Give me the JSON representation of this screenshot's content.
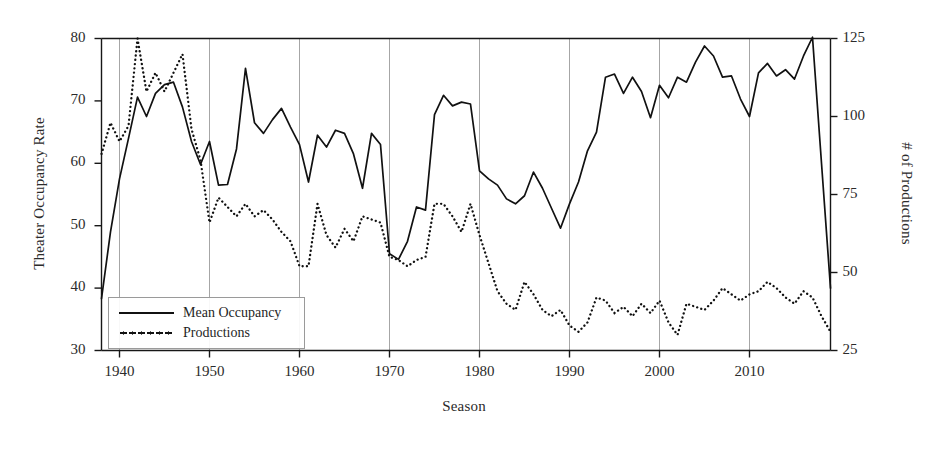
{
  "chart_data": {
    "type": "line",
    "title": "",
    "xlabel": "Season",
    "ylabel": "Theater Occupancy Rate",
    "ylabel_right": "# of Productions",
    "xlim": [
      1938,
      2019
    ],
    "ylim": [
      30,
      80
    ],
    "ylim_right": [
      25,
      125
    ],
    "grid": "vertical gridlines at each decade",
    "legend_position": "lower left, inside axes",
    "xticks": [
      1940,
      1950,
      1960,
      1970,
      1980,
      1990,
      2000,
      2010
    ],
    "xtick_labels": [
      "1940",
      "1950",
      "1960",
      "1970",
      "1980",
      "1990",
      "2000",
      "2010"
    ],
    "yticks_left": [
      30,
      40,
      50,
      60,
      70,
      80
    ],
    "ytick_labels_left": [
      "30",
      "40",
      "50",
      "60",
      "70",
      "80"
    ],
    "yticks_right": [
      25,
      50,
      75,
      100,
      125
    ],
    "ytick_labels_right": [
      "25",
      "50",
      "75",
      "100",
      "125"
    ],
    "x": [
      1938,
      1939,
      1940,
      1941,
      1942,
      1943,
      1944,
      1945,
      1946,
      1947,
      1948,
      1949,
      1950,
      1951,
      1952,
      1953,
      1954,
      1955,
      1956,
      1957,
      1958,
      1959,
      1960,
      1961,
      1962,
      1963,
      1964,
      1965,
      1966,
      1967,
      1968,
      1969,
      1970,
      1971,
      1972,
      1973,
      1974,
      1975,
      1976,
      1977,
      1978,
      1979,
      1980,
      1981,
      1982,
      1983,
      1984,
      1985,
      1986,
      1987,
      1988,
      1989,
      1990,
      1991,
      1992,
      1993,
      1994,
      1995,
      1996,
      1997,
      1998,
      1999,
      2000,
      2001,
      2002,
      2003,
      2004,
      2005,
      2006,
      2007,
      2008,
      2009,
      2010,
      2011,
      2012,
      2013,
      2014,
      2015,
      2016,
      2017,
      2018,
      2019
    ],
    "series": [
      {
        "name": "Mean Occupancy",
        "style": "solid",
        "axis": "left",
        "color": "#111111",
        "values": [
          38.3,
          49.0,
          57.5,
          64.0,
          70.6,
          67.5,
          71.2,
          72.6,
          73.0,
          69.0,
          63.5,
          59.8,
          63.5,
          56.5,
          56.6,
          62.3,
          75.2,
          66.5,
          64.8,
          67.0,
          68.8,
          65.8,
          63.0,
          57.0,
          64.5,
          62.6,
          65.3,
          64.8,
          61.5,
          56.0,
          64.8,
          63.0,
          45.5,
          44.6,
          47.5,
          53.0,
          52.5,
          67.8,
          70.9,
          69.2,
          69.8,
          69.5,
          58.8,
          57.5,
          56.5,
          54.3,
          53.5,
          54.8,
          58.6,
          56.0,
          52.8,
          49.6,
          53.5,
          57.0,
          62.0,
          65.0,
          73.8,
          74.3,
          71.2,
          73.8,
          71.5,
          67.3,
          72.5,
          70.5,
          73.8,
          73.0,
          76.2,
          78.8,
          77.2,
          73.8,
          74.0,
          70.3,
          67.5,
          74.5,
          76.0,
          74.0,
          75.0,
          73.5,
          77.2,
          80.2,
          60.0,
          40.0
        ]
      },
      {
        "name": "Productions",
        "style": "dotted",
        "axis": "right",
        "color": "#111111",
        "values": [
          88,
          98,
          92,
          97,
          125,
          108,
          114,
          108,
          114,
          120,
          96,
          86,
          66,
          74,
          71,
          68,
          72,
          68,
          70,
          67,
          63,
          60,
          52,
          52,
          72,
          62,
          58,
          64,
          60,
          68,
          67,
          66,
          55,
          54,
          52,
          54,
          55,
          72,
          72,
          68,
          63,
          72,
          62,
          53,
          44,
          40,
          38,
          47,
          43,
          38,
          36,
          38,
          33,
          31,
          34,
          42,
          41,
          37,
          39,
          36,
          40,
          37,
          41,
          34,
          30,
          40,
          39,
          38,
          41,
          45,
          43,
          41,
          43,
          44,
          47,
          45,
          42,
          40,
          44,
          42,
          36,
          31
        ]
      }
    ]
  }
}
